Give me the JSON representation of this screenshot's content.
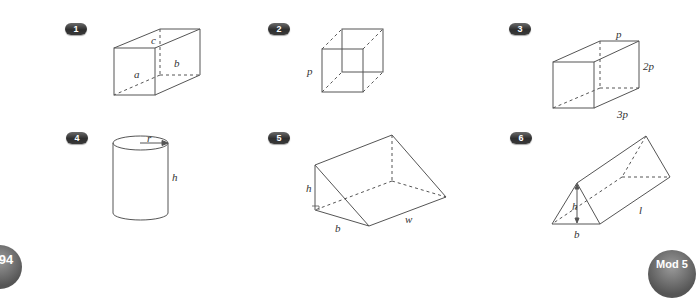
{
  "problems": [
    {
      "number": "1",
      "shape": "cuboid",
      "labels": {
        "a": "a",
        "b": "b",
        "c": "c"
      }
    },
    {
      "number": "2",
      "shape": "cube",
      "labels": {
        "side": "p"
      }
    },
    {
      "number": "3",
      "shape": "cuboid",
      "labels": {
        "top": "p",
        "height": "2p",
        "depth": "3p"
      }
    },
    {
      "number": "4",
      "shape": "cylinder",
      "labels": {
        "radius": "r",
        "height": "h"
      }
    },
    {
      "number": "5",
      "shape": "right-triangular-prism",
      "labels": {
        "height": "h",
        "base": "b",
        "width": "w"
      }
    },
    {
      "number": "6",
      "shape": "triangular-prism",
      "labels": {
        "height": "h",
        "base": "b",
        "length": "l"
      }
    }
  ],
  "footer": {
    "page_number": "94",
    "module": "Mod 5"
  },
  "colors": {
    "line": "#555555",
    "badge": "#3a3a3a"
  }
}
